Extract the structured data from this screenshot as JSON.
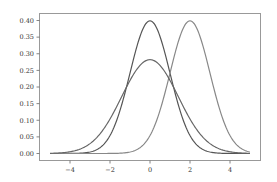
{
  "chart_data": {
    "type": "line",
    "title": "",
    "xlabel": "",
    "ylabel": "",
    "xlim": [
      -5.5,
      5.5
    ],
    "ylim": [
      -0.018,
      0.418
    ],
    "x_ticks": [
      -4,
      -2,
      0,
      2,
      4
    ],
    "x_tick_labels": [
      "−4",
      "−2",
      "0",
      "2",
      "4"
    ],
    "y_ticks": [
      0.0,
      0.05,
      0.1,
      0.15,
      0.2,
      0.25,
      0.3,
      0.35,
      0.4
    ],
    "y_tick_labels": [
      "0.00",
      "0.05",
      "0.10",
      "0.15",
      "0.20",
      "0.25",
      "0.30",
      "0.35",
      "0.40"
    ],
    "grid": false,
    "legend": null,
    "x_range_plotted": [
      -5,
      5
    ],
    "series": [
      {
        "name": "Normal(μ=0, σ=1)",
        "mean": 0,
        "std": 1,
        "peak": 0.399,
        "color": "#555555"
      },
      {
        "name": "Normal(μ=2, σ=1)",
        "mean": 2,
        "std": 1,
        "peak": 0.399,
        "color": "#888888"
      },
      {
        "name": "Normal(μ=0, σ=1.414)",
        "mean": 0,
        "std": 1.414,
        "peak": 0.282,
        "color": "#666666"
      }
    ]
  }
}
